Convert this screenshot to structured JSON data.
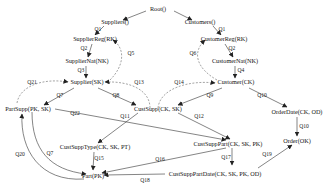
{
  "diagram": {
    "nodes": {
      "root": "Root()",
      "suppliers": "Suppliers()",
      "customers": "Customers()",
      "supplier_reg": "SupplierReg(RK)",
      "customer_reg": "CustomerReg(RK)",
      "supplier_nat": "SupplierNat(NK)",
      "customer_nat": "CustomerNat(NK)",
      "supplier": "Supplier(SK)",
      "customer": "Customer(CK)",
      "part_supp": "PartSupp(PK, SK)",
      "cust_supp": "CustSupp(CK, SK)",
      "order_date": "OrderDate(CK, OD)",
      "cust_supp_type": "CustSuppType(CK, SK, PT)",
      "cust_supp_part": "CustSuppPart(CK, SK, PK)",
      "order": "Order(OK)",
      "part": "Part(PK)",
      "cust_supp_part_date": "CustSuppPartDate(CK, SK, PK, OD)"
    },
    "edges": {
      "q1a": "Q1",
      "q1b": "Q1",
      "q2a": "Q2",
      "q2b": "Q2",
      "q3": "Q3",
      "q4": "Q4",
      "q5": "Q5",
      "q6": "Q6",
      "q7a": "Q7",
      "q7b": "Q7",
      "q8": "Q8",
      "q9": "Q9",
      "q10a": "Q10",
      "q10b": "Q10",
      "q11": "Q11",
      "q12": "Q12",
      "q13": "Q13",
      "q14": "Q14",
      "q15": "Q15",
      "q16": "Q16",
      "q17": "Q17",
      "q18": "Q18",
      "q19": "Q19",
      "q20": "Q20",
      "q21": "Q21",
      "q22": "Q22"
    }
  }
}
